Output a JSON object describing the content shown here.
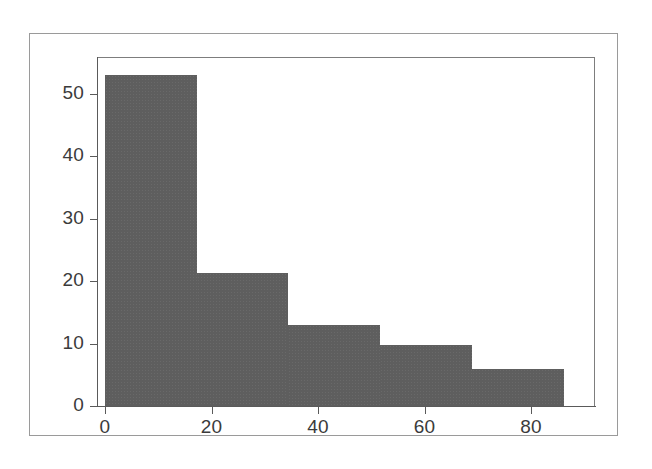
{
  "figure": {
    "background_color": "#ffffff",
    "frame_color": "#9a9a9a",
    "axis_color": "#5a5a5a",
    "bar_color": "#5e5e5e"
  },
  "chart_data": {
    "type": "bar",
    "subtype": "histogram",
    "title": "",
    "subtitle": "",
    "xlabel": "",
    "ylabel": "",
    "xlim": [
      -1.5,
      92.0
    ],
    "ylim": [
      0,
      55.9
    ],
    "grid": false,
    "legend": null,
    "bin_width": 17.2,
    "bin_edges": [
      0,
      17.2,
      34.4,
      51.6,
      68.9,
      86.1
    ],
    "categories": [
      "0-17.2",
      "17.2-34.4",
      "34.4-51.6",
      "51.6-68.9",
      "68.9-86.1"
    ],
    "values": [
      53,
      21.3,
      13,
      9.7,
      6
    ],
    "bars": [
      {
        "label": "bin-1",
        "x_start": 0,
        "x_end": 17.2,
        "value": 53
      },
      {
        "label": "bin-2",
        "x_start": 17.2,
        "x_end": 34.4,
        "value": 21.3
      },
      {
        "label": "bin-3",
        "x_start": 34.4,
        "x_end": 51.6,
        "value": 13
      },
      {
        "label": "bin-4",
        "x_start": 51.6,
        "x_end": 68.9,
        "value": 9.7
      },
      {
        "label": "bin-5",
        "x_start": 68.9,
        "x_end": 86.1,
        "value": 6
      }
    ],
    "xticks": [
      0,
      20,
      40,
      60,
      80
    ],
    "xticklabels": [
      "0",
      "20",
      "40",
      "60",
      "80"
    ],
    "yticks": [
      0,
      10,
      20,
      30,
      40,
      50
    ],
    "yticklabels": [
      "0",
      "10",
      "20",
      "30",
      "40",
      "50"
    ],
    "annotations": []
  }
}
